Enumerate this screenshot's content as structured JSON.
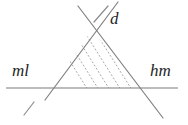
{
  "figure": {
    "type": "geometric-diagram",
    "background_color": "#ffffff",
    "line_color": "#808080",
    "hatch_color": "#a8a8a8",
    "baseline_color": "#7a7a7a",
    "label_color": "#262626",
    "labels": {
      "left": "ml",
      "right": "hm",
      "top": "d"
    },
    "elements": {
      "baseline": "horizontal-line",
      "left_diagonal": "line-up-right",
      "right_diagonal": "line-down-right",
      "interior_fill": "dotted-hatching",
      "tick_marks": 3
    },
    "geometry": {
      "baseline": {
        "x1": 6,
        "y1": 88,
        "x2": 178,
        "y2": 88
      },
      "left_diagonal": {
        "x1": 45,
        "y1": 100,
        "x2": 118,
        "y2": 2
      },
      "right_diagonal": {
        "x1": 78,
        "y1": 6,
        "x2": 163,
        "y2": 118
      },
      "apex": {
        "x": 92,
        "y": 30
      },
      "base_left": {
        "x": 51,
        "y": 88
      },
      "base_right": {
        "x": 141,
        "y": 88
      },
      "hatch_line_count": 8,
      "hatch_dash": "1.2 2.6"
    },
    "ticks": [
      {
        "name": "tick-below-baseline",
        "x1": 24,
        "y1": 115,
        "x2": 34,
        "y2": 102
      },
      {
        "name": "tick-near-d-label",
        "x1": 94,
        "y1": 22,
        "x2": 108,
        "y2": 6
      },
      {
        "name": "underline-hm",
        "x1": 148,
        "y1": 88,
        "x2": 184,
        "y2": 88
      }
    ]
  }
}
